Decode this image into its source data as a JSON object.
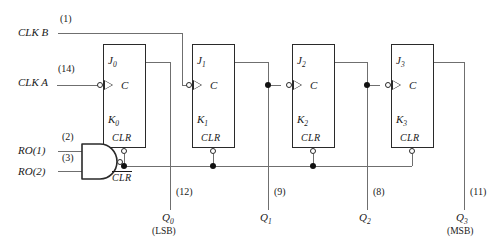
{
  "diagram": {
    "inputs": [
      {
        "name": "CLK B",
        "pin": "(1)"
      },
      {
        "name": "CLK A",
        "pin": "(14)"
      },
      {
        "name": "RO(1)",
        "pin": "(2)"
      },
      {
        "name": "RO(2)",
        "pin": "(3)"
      }
    ],
    "gate": {
      "type": "nand-gate",
      "output_label": "CLR"
    },
    "flipflops": [
      {
        "j": "J",
        "jsub": "0",
        "k": "K",
        "ksub": "0",
        "clock": "C",
        "clear": "CLR"
      },
      {
        "j": "J",
        "jsub": "1",
        "k": "K",
        "ksub": "1",
        "clock": "C",
        "clear": "CLR"
      },
      {
        "j": "J",
        "jsub": "2",
        "k": "K",
        "ksub": "2",
        "clock": "C",
        "clear": "CLR"
      },
      {
        "j": "J",
        "jsub": "3",
        "k": "K",
        "ksub": "3",
        "clock": "C",
        "clear": "CLR"
      }
    ],
    "outputs": [
      {
        "name": "Q",
        "sub": "0",
        "pin": "(12)",
        "note": "(LSB)"
      },
      {
        "name": "Q",
        "sub": "1",
        "pin": "(9)",
        "note": ""
      },
      {
        "name": "Q",
        "sub": "2",
        "pin": "(8)",
        "note": ""
      },
      {
        "name": "Q",
        "sub": "3",
        "pin": "(11)",
        "note": "(MSB)"
      }
    ],
    "colors": {
      "wire": "#6f6f6f",
      "box": "#2a2a2a",
      "text": "#1a1a1a"
    }
  }
}
